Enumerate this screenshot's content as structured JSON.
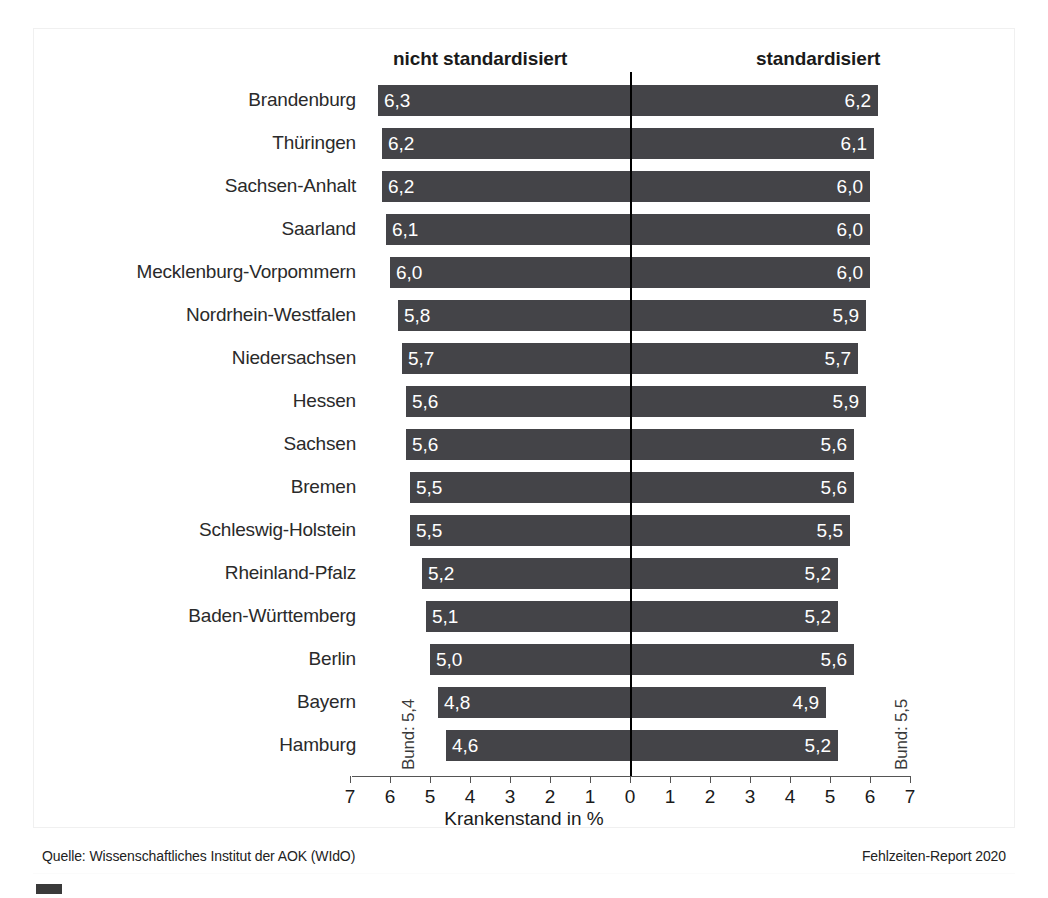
{
  "headers": {
    "left": "nicht standardisiert",
    "right": "standardisiert"
  },
  "axis_title": "Krankenstand in %",
  "annotations": {
    "bund_left": "Bund: 5,4",
    "bund_right": "Bund: 5,5"
  },
  "footer": {
    "source": "Quelle: Wissenschaftliches Institut der AOK (WIdO)",
    "report": "Fehlzeiten-Report 2020"
  },
  "colors": {
    "bar": "#444448",
    "axis": "#555555",
    "zero_line": "#000000",
    "value_text": "#ffffff"
  },
  "chart_data": {
    "type": "bar",
    "orientation": "horizontal-diverging",
    "title": "",
    "xlabel": "Krankenstand in %",
    "ylabel": "",
    "xlim": [
      -7,
      7
    ],
    "xticks": [
      7,
      6,
      5,
      4,
      3,
      2,
      1,
      0,
      1,
      2,
      3,
      4,
      5,
      6,
      7
    ],
    "grid": false,
    "legend_position": "top",
    "categories": [
      "Brandenburg",
      "Thüringen",
      "Sachsen-Anhalt",
      "Saarland",
      "Mecklenburg-Vorpommern",
      "Nordrhein-Westfalen",
      "Niedersachsen",
      "Hessen",
      "Sachsen",
      "Bremen",
      "Schleswig-Holstein",
      "Rheinland-Pfalz",
      "Baden-Württemberg",
      "Berlin",
      "Bayern",
      "Hamburg"
    ],
    "series": [
      {
        "name": "nicht standardisiert",
        "side": "left",
        "values": [
          6.3,
          6.2,
          6.2,
          6.1,
          6.0,
          5.8,
          5.7,
          5.6,
          5.6,
          5.5,
          5.5,
          5.2,
          5.1,
          5.0,
          4.8,
          4.6
        ],
        "labels": [
          "6,3",
          "6,2",
          "6,2",
          "6,1",
          "6,0",
          "5,8",
          "5,7",
          "5,6",
          "5,6",
          "5,5",
          "5,5",
          "5,2",
          "5,1",
          "5,0",
          "4,8",
          "4,6"
        ],
        "reference_line_label": "Bund: 5,4",
        "reference_line_value": 5.4
      },
      {
        "name": "standardisiert",
        "side": "right",
        "values": [
          6.2,
          6.1,
          6.0,
          6.0,
          6.0,
          5.9,
          5.7,
          5.9,
          5.6,
          5.6,
          5.5,
          5.2,
          5.2,
          5.6,
          4.9,
          5.2
        ],
        "labels": [
          "6,2",
          "6,1",
          "6,0",
          "6,0",
          "6,0",
          "5,9",
          "5,7",
          "5,9",
          "5,6",
          "5,6",
          "5,5",
          "5,2",
          "5,2",
          "5,6",
          "4,9",
          "5,2"
        ],
        "reference_line_label": "Bund: 5,5",
        "reference_line_value": 5.5
      }
    ]
  },
  "geometry": {
    "zero_x": 630,
    "unit_px": 40,
    "first_bar_top": 85,
    "bar_pitch": 43,
    "bar_height": 31
  }
}
